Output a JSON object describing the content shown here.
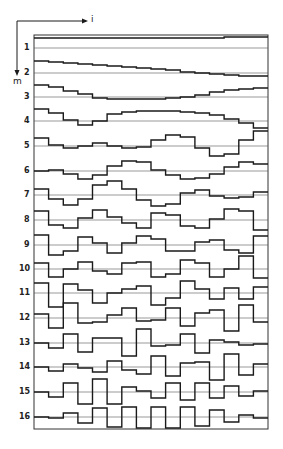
{
  "figure": {
    "axis_horizontal_label": "i",
    "axis_vertical_label": "m",
    "frame": {
      "left": 34,
      "top": 35,
      "right": 268,
      "bottom": 429
    },
    "columns": 16,
    "line_color": "#1a1a1a",
    "baseline_color": "#555555"
  },
  "rows": [
    {
      "label": "1",
      "baseline": 48,
      "steps": [
        -10,
        -10,
        -10,
        -10,
        -10,
        -10,
        -10,
        -10,
        -10,
        -10,
        -10,
        -10,
        -10,
        -11,
        -11,
        -11
      ]
    },
    {
      "label": "2",
      "baseline": 73,
      "steps": [
        -12,
        -11,
        -10,
        -9,
        -8,
        -7,
        -6,
        -5,
        -4,
        -3,
        -1,
        0,
        1,
        2,
        3,
        3
      ]
    },
    {
      "label": "3",
      "baseline": 97,
      "steps": [
        -12,
        -10,
        -6,
        -3,
        1,
        2,
        2,
        2,
        2,
        1,
        0,
        -2,
        -5,
        -7,
        -8,
        -9
      ]
    },
    {
      "label": "4",
      "baseline": 121,
      "steps": [
        -12,
        -8,
        -1,
        4,
        0,
        -7,
        -9,
        -10,
        -10,
        -10,
        -9,
        -8,
        -6,
        -2,
        2,
        7
      ]
    },
    {
      "label": "5",
      "baseline": 146,
      "steps": [
        -8,
        -1,
        2,
        0,
        -3,
        0,
        2,
        1,
        -6,
        -11,
        -9,
        2,
        10,
        8,
        -6,
        -15
      ]
    },
    {
      "label": "6",
      "baseline": 171,
      "steps": [
        0,
        -1,
        3,
        8,
        4,
        -5,
        -10,
        -9,
        -1,
        4,
        8,
        7,
        3,
        -4,
        -9,
        -7
      ]
    },
    {
      "label": "7",
      "baseline": 195,
      "steps": [
        -6,
        4,
        10,
        4,
        -10,
        -14,
        -6,
        5,
        11,
        9,
        -2,
        -5,
        1,
        3,
        2,
        -3
      ]
    },
    {
      "label": "8",
      "baseline": 220,
      "steps": [
        -9,
        5,
        8,
        -2,
        -10,
        -3,
        3,
        8,
        -7,
        -5,
        6,
        8,
        -1,
        -11,
        -9,
        10
      ]
    },
    {
      "label": "9",
      "baseline": 245,
      "steps": [
        -10,
        10,
        6,
        -8,
        -2,
        8,
        -2,
        -9,
        -6,
        6,
        6,
        -3,
        -5,
        5,
        8,
        -9
      ]
    },
    {
      "label": "10",
      "baseline": 269,
      "steps": [
        -6,
        8,
        0,
        -7,
        2,
        5,
        -6,
        -7,
        8,
        5,
        -9,
        -6,
        8,
        0,
        -13,
        9
      ]
    },
    {
      "label": "11",
      "baseline": 293,
      "steps": [
        -10,
        14,
        -9,
        -3,
        10,
        0,
        -4,
        -7,
        12,
        5,
        -12,
        -4,
        6,
        -5,
        6,
        -6
      ]
    },
    {
      "label": "12",
      "baseline": 318,
      "steps": [
        -4,
        10,
        -15,
        5,
        4,
        -3,
        -10,
        3,
        2,
        -10,
        8,
        -5,
        -8,
        13,
        -13,
        4
      ]
    },
    {
      "label": "13",
      "baseline": 343,
      "steps": [
        0,
        5,
        -9,
        9,
        -5,
        -5,
        13,
        -14,
        3,
        2,
        -9,
        10,
        -3,
        -1,
        2,
        1
      ]
    },
    {
      "label": "14",
      "baseline": 367,
      "steps": [
        0,
        4,
        -3,
        1,
        5,
        -6,
        3,
        7,
        -11,
        9,
        -4,
        -5,
        13,
        -13,
        8,
        -3
      ]
    },
    {
      "label": "15",
      "baseline": 392,
      "steps": [
        0,
        5,
        -9,
        12,
        -13,
        12,
        -5,
        -1,
        6,
        -9,
        8,
        -9,
        6,
        -6,
        4,
        -1
      ]
    },
    {
      "label": "16",
      "baseline": 417,
      "steps": [
        0,
        1,
        -4,
        6,
        -9,
        10,
        -10,
        11,
        -10,
        11,
        -10,
        9,
        -7,
        5,
        -2,
        1
      ]
    }
  ]
}
